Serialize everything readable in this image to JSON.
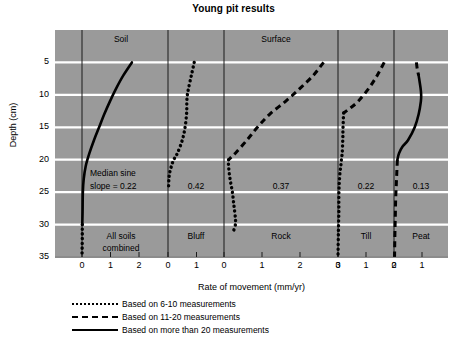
{
  "chart_data": {
    "type": "line",
    "title": "Young pit results",
    "xlabel": "Rate of movement (mm/yr)",
    "ylabel": "Depth (cm)",
    "ylim": [
      0,
      35
    ],
    "y_ticks": [
      5,
      10,
      15,
      20,
      25,
      30,
      35
    ],
    "grid": "horizontal white gridlines at each depth tick",
    "group_labels": [
      {
        "text": "Soil",
        "panel": 0
      },
      {
        "text": "Surface",
        "panel": 2
      }
    ],
    "median_sine_slope_note": "Median sine slope = 0.22",
    "panels": [
      {
        "name": "All soils combined",
        "label_lines": [
          "All soils",
          "combined"
        ],
        "median_sine_slope": "0.22",
        "x_ticks": [
          0,
          1,
          2
        ],
        "xlim": [
          -0.4,
          2.6
        ],
        "line_style": "solid",
        "measurements": "more than 20",
        "points": [
          {
            "depth": 5,
            "rate": 1.75
          },
          {
            "depth": 7,
            "rate": 1.45
          },
          {
            "depth": 9,
            "rate": 1.2
          },
          {
            "depth": 11,
            "rate": 0.98
          },
          {
            "depth": 13,
            "rate": 0.78
          },
          {
            "depth": 15,
            "rate": 0.6
          },
          {
            "depth": 17,
            "rate": 0.42
          },
          {
            "depth": 19,
            "rate": 0.26
          },
          {
            "depth": 21,
            "rate": 0.13
          },
          {
            "depth": 23,
            "rate": 0.06
          },
          {
            "depth": 25,
            "rate": 0.03
          },
          {
            "depth": 28,
            "rate": 0.02
          },
          {
            "depth": 30,
            "rate": 0.01
          }
        ],
        "tail_style": "dotted",
        "tail_points": [
          {
            "depth": 30,
            "rate": 0.01
          },
          {
            "depth": 32,
            "rate": 0.01
          },
          {
            "depth": 35,
            "rate": 0.0
          }
        ]
      },
      {
        "name": "Bluff",
        "label_lines": [
          "Bluff"
        ],
        "median_sine_slope": "0.42",
        "x_ticks": [
          0,
          1
        ],
        "xlim": [
          -0.35,
          1.6
        ],
        "line_style": "dotted",
        "measurements": "6-10",
        "points": [
          {
            "depth": 5,
            "rate": 0.92
          },
          {
            "depth": 7,
            "rate": 0.82
          },
          {
            "depth": 9,
            "rate": 0.72
          },
          {
            "depth": 10,
            "rate": 0.68
          },
          {
            "depth": 11,
            "rate": 0.66
          },
          {
            "depth": 12,
            "rate": 0.66
          },
          {
            "depth": 13,
            "rate": 0.65
          },
          {
            "depth": 15,
            "rate": 0.6
          },
          {
            "depth": 17,
            "rate": 0.5
          },
          {
            "depth": 19,
            "rate": 0.33
          },
          {
            "depth": 20,
            "rate": 0.2
          },
          {
            "depth": 21,
            "rate": 0.12
          },
          {
            "depth": 22,
            "rate": 0.06
          },
          {
            "depth": 23,
            "rate": 0.03
          },
          {
            "depth": 24.5,
            "rate": 0.02
          }
        ]
      },
      {
        "name": "Rock",
        "label_lines": [
          "Rock"
        ],
        "median_sine_slope": "0.37",
        "x_ticks": [
          0,
          1,
          2,
          3
        ],
        "xlim": [
          -0.45,
          3.35
        ],
        "line_style": "dashed",
        "measurements": "11-20",
        "points": [
          {
            "depth": 5,
            "rate": 2.62
          },
          {
            "depth": 7,
            "rate": 2.35
          },
          {
            "depth": 9,
            "rate": 2.0
          },
          {
            "depth": 11,
            "rate": 1.62
          },
          {
            "depth": 13,
            "rate": 1.2
          },
          {
            "depth": 15,
            "rate": 0.88
          },
          {
            "depth": 17,
            "rate": 0.6
          },
          {
            "depth": 19,
            "rate": 0.3
          },
          {
            "depth": 20,
            "rate": 0.12
          }
        ],
        "tail_style": "dotted",
        "tail_points": [
          {
            "depth": 20,
            "rate": 0.12
          },
          {
            "depth": 21,
            "rate": 0.12
          },
          {
            "depth": 23,
            "rate": 0.16
          },
          {
            "depth": 25,
            "rate": 0.22
          },
          {
            "depth": 27,
            "rate": 0.26
          },
          {
            "depth": 29,
            "rate": 0.3
          },
          {
            "depth": 30,
            "rate": 0.3
          },
          {
            "depth": 31,
            "rate": 0.25
          }
        ]
      },
      {
        "name": "Till",
        "label_lines": [
          "Till"
        ],
        "median_sine_slope": "0.22",
        "x_ticks": [
          0,
          1,
          2
        ],
        "xlim": [
          -0.45,
          2.35
        ],
        "line_style": "dashed",
        "measurements": "11-20",
        "points": [
          {
            "depth": 5,
            "rate": 1.65
          },
          {
            "depth": 7,
            "rate": 1.4
          },
          {
            "depth": 9,
            "rate": 1.1
          },
          {
            "depth": 11,
            "rate": 0.72
          },
          {
            "depth": 12,
            "rate": 0.45
          },
          {
            "depth": 12.8,
            "rate": 0.2
          }
        ],
        "tail_style": "dotted",
        "tail_points": [
          {
            "depth": 12.8,
            "rate": 0.2
          },
          {
            "depth": 15,
            "rate": 0.18
          },
          {
            "depth": 17,
            "rate": 0.17
          },
          {
            "depth": 19,
            "rate": 0.15
          },
          {
            "depth": 20,
            "rate": 0.12
          },
          {
            "depth": 21,
            "rate": 0.1
          },
          {
            "depth": 22,
            "rate": 0.07
          },
          {
            "depth": 24,
            "rate": 0.04
          },
          {
            "depth": 26,
            "rate": 0.03
          },
          {
            "depth": 28,
            "rate": 0.03
          },
          {
            "depth": 30,
            "rate": 0.02
          },
          {
            "depth": 32,
            "rate": 0.01
          },
          {
            "depth": 35,
            "rate": 0.0
          }
        ]
      },
      {
        "name": "Peat",
        "label_lines": [
          "Peat"
        ],
        "median_sine_slope": "0.13",
        "x_ticks": [
          0,
          1
        ],
        "xlim": [
          -0.4,
          1.6
        ],
        "line_style": "solid",
        "measurements": "more than 20",
        "head_style": "dashed",
        "head_points": [
          {
            "depth": 5,
            "rate": 0.8
          },
          {
            "depth": 6,
            "rate": 0.83
          },
          {
            "depth": 7,
            "rate": 0.88
          }
        ],
        "points": [
          {
            "depth": 7,
            "rate": 0.88
          },
          {
            "depth": 9,
            "rate": 0.95
          },
          {
            "depth": 10,
            "rate": 0.97
          },
          {
            "depth": 11,
            "rate": 0.96
          },
          {
            "depth": 13,
            "rate": 0.88
          },
          {
            "depth": 15,
            "rate": 0.74
          },
          {
            "depth": 17,
            "rate": 0.5
          },
          {
            "depth": 18,
            "rate": 0.3
          },
          {
            "depth": 19,
            "rate": 0.18
          },
          {
            "depth": 20,
            "rate": 0.12
          }
        ],
        "tail_style": "dashed",
        "tail_points": [
          {
            "depth": 20,
            "rate": 0.12
          },
          {
            "depth": 22,
            "rate": 0.1
          },
          {
            "depth": 24,
            "rate": 0.08
          },
          {
            "depth": 26,
            "rate": 0.06
          },
          {
            "depth": 28,
            "rate": 0.05
          },
          {
            "depth": 30,
            "rate": 0.04
          },
          {
            "depth": 32,
            "rate": 0.03
          },
          {
            "depth": 35,
            "rate": 0.02
          }
        ]
      }
    ],
    "legend": {
      "position": "below-axis",
      "entries": [
        {
          "style": "dotted",
          "label": "Based on 6-10 measurements"
        },
        {
          "style": "dashed",
          "label": "Based on 11-20 measurements"
        },
        {
          "style": "solid",
          "label": "Based on more than 20 measurements"
        }
      ]
    },
    "colors": {
      "plot_background": "#9a9a9a",
      "gridline": "#ffffff",
      "line": "#000000",
      "page_background": "#ffffff"
    }
  }
}
